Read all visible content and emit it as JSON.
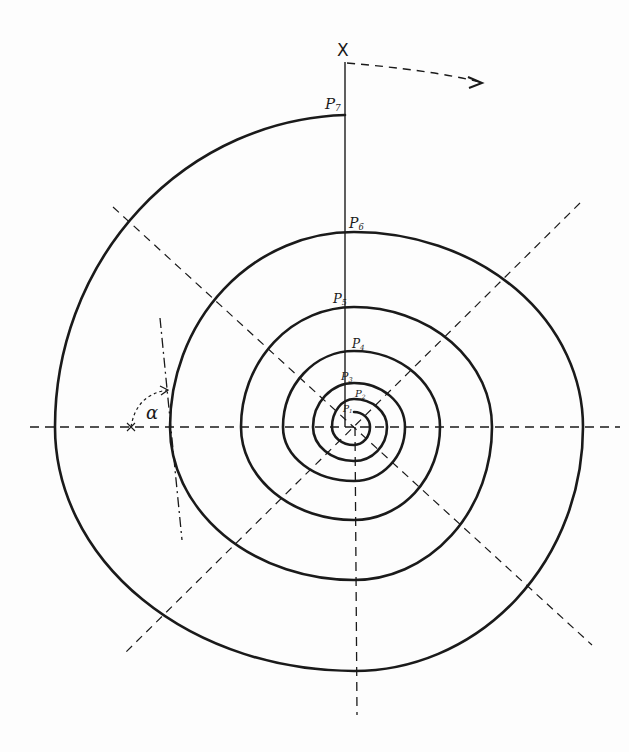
{
  "diagram": {
    "type": "logarithmic-spiral construction",
    "axis_label": "X",
    "angle_label": "α",
    "points": [
      {
        "name": "P",
        "sub": "1"
      },
      {
        "name": "P",
        "sub": "2"
      },
      {
        "name": "P",
        "sub": "3"
      },
      {
        "name": "P",
        "sub": "4"
      },
      {
        "name": "P",
        "sub": "5"
      },
      {
        "name": "P",
        "sub": "6"
      },
      {
        "name": "P",
        "sub": "7"
      }
    ],
    "center": [
      354,
      427
    ],
    "rotation_arrow": "clockwise (dashed arrow from X)",
    "colors": {
      "ink": "#1a1a1a",
      "paper": "#fdfdfd"
    }
  }
}
